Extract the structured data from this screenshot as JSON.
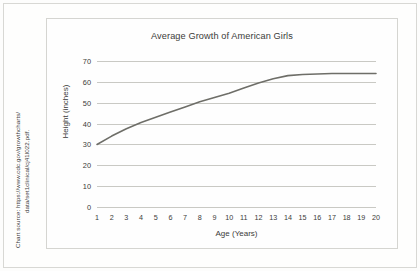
{
  "source_note": {
    "line1": "Chart source: https://www.cdc.gov/growthcharts/",
    "line2": "data/set1clinical/cj41l022.pdf."
  },
  "chart_data": {
    "type": "line",
    "title": "Average Growth of American Girls",
    "xlabel": "Age (Years)",
    "ylabel": "Height (inches)",
    "x": [
      1,
      2,
      3,
      4,
      5,
      6,
      7,
      8,
      9,
      10,
      11,
      12,
      13,
      14,
      15,
      16,
      17,
      18,
      19,
      20
    ],
    "xticklabels": [
      "1",
      "2",
      "3",
      "4",
      "5",
      "6",
      "7",
      "8",
      "9",
      "10",
      "11",
      "12",
      "13",
      "14",
      "15",
      "16",
      "17",
      "18",
      "19",
      "20"
    ],
    "values": [
      30,
      34,
      37.5,
      40.5,
      43,
      45.5,
      48,
      50.5,
      52.5,
      54.5,
      57,
      59.5,
      61.5,
      63,
      63.5,
      63.8,
      64,
      64,
      64,
      64
    ],
    "yticks": [
      0,
      10,
      20,
      30,
      40,
      50,
      60,
      70
    ],
    "yticklabels": [
      "0",
      "10",
      "20",
      "30",
      "40",
      "50",
      "60",
      "70"
    ],
    "ylim": [
      0,
      70
    ],
    "xlim": [
      1,
      20
    ],
    "grid": "horizontal",
    "legend": "none",
    "series_color": "#6e6e68",
    "grid_color": "#c9c9c4",
    "background": "#fefefe"
  }
}
